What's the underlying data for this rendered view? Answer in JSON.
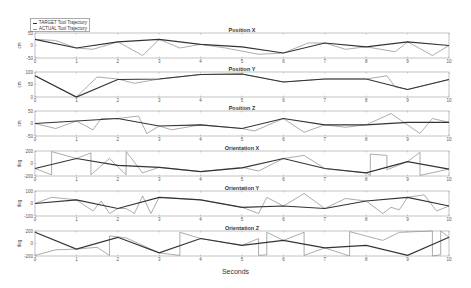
{
  "chart_data": {
    "type": "line",
    "xlabel": "Seconds",
    "xlim": [
      0,
      10
    ],
    "xticks": [
      0,
      1,
      2,
      3,
      4,
      5,
      6,
      7,
      8,
      9,
      10
    ],
    "legend": {
      "position": "top-left",
      "entries": [
        "TARGET Tool Trajectory",
        "ACTUAL Tool Trajectory"
      ]
    },
    "grid": false,
    "subplots": [
      {
        "title": "Position X",
        "ylabel": "cm",
        "ylim": [
          -50,
          50
        ],
        "yticks": [
          -50,
          0,
          50
        ],
        "target": {
          "x": [
            0,
            1,
            2,
            3,
            4,
            5,
            6,
            7,
            8,
            9,
            10
          ],
          "y": [
            25,
            -10,
            15,
            25,
            5,
            -5,
            -30,
            10,
            -5,
            15,
            0
          ]
        },
        "actual": {
          "x": [
            0,
            0.5,
            1,
            1.4,
            2,
            2.6,
            3,
            3.5,
            4,
            4.6,
            5.4,
            6,
            6.6,
            7,
            7.5,
            8,
            8.7,
            9,
            9.6,
            10
          ],
          "y": [
            25,
            20,
            -10,
            -15,
            15,
            -40,
            25,
            -10,
            5,
            -10,
            -35,
            -30,
            10,
            10,
            -15,
            -5,
            -25,
            15,
            -40,
            0
          ]
        }
      },
      {
        "title": "Position Y",
        "ylabel": "cm",
        "ylim": [
          0,
          100
        ],
        "yticks": [
          0,
          50,
          100
        ],
        "target": {
          "x": [
            0,
            1,
            2,
            3,
            4,
            5,
            6,
            7,
            8,
            9,
            10
          ],
          "y": [
            85,
            0,
            70,
            72,
            90,
            92,
            60,
            72,
            72,
            30,
            70
          ]
        },
        "actual": {
          "x": [
            0,
            1,
            1.5,
            2,
            2.4,
            3,
            4,
            5,
            6,
            7,
            8,
            8.5,
            8.7,
            9,
            10
          ],
          "y": [
            85,
            0,
            80,
            72,
            55,
            72,
            90,
            92,
            60,
            72,
            72,
            85,
            40,
            30,
            70
          ]
        }
      },
      {
        "title": "Position Z",
        "ylabel": "cm",
        "ylim": [
          -50,
          50
        ],
        "yticks": [
          -50,
          0,
          50
        ],
        "target": {
          "x": [
            0,
            1,
            2,
            3,
            4,
            5,
            6,
            7,
            8,
            9,
            10
          ],
          "y": [
            0,
            10,
            20,
            -10,
            -5,
            -20,
            20,
            -5,
            -5,
            5,
            5
          ]
        },
        "actual": {
          "x": [
            0,
            0.5,
            1,
            1.4,
            1.6,
            2,
            2.5,
            2.7,
            3,
            3.3,
            4,
            5,
            5.3,
            6,
            6.5,
            7,
            7.5,
            8,
            8.6,
            9.3,
            9.6,
            10
          ],
          "y": [
            0,
            -20,
            10,
            -25,
            20,
            20,
            30,
            -40,
            -10,
            -25,
            -5,
            -20,
            -30,
            20,
            -35,
            -5,
            -15,
            -5,
            40,
            -40,
            20,
            5
          ]
        }
      },
      {
        "title": "Orientation X",
        "ylabel": "deg",
        "ylim": [
          -200,
          200
        ],
        "yticks": [
          -200,
          0,
          200
        ],
        "target": {
          "x": [
            0,
            1,
            2,
            3,
            4,
            5,
            6,
            7,
            8,
            9,
            10
          ],
          "y": [
            -80,
            80,
            -30,
            -60,
            -130,
            -70,
            80,
            -80,
            -150,
            30,
            -90
          ]
        },
        "actual": {
          "x": [
            0,
            0.4,
            0.4,
            1,
            1.35,
            1.35,
            1.8,
            2.2,
            2.2,
            2.6,
            3,
            4,
            5,
            5.4,
            6,
            6.5,
            7,
            8,
            8.1,
            8.1,
            8.5,
            8.5,
            9,
            9.3,
            9.3,
            10
          ],
          "y": [
            -80,
            -180,
            190,
            80,
            170,
            -180,
            80,
            -180,
            190,
            -150,
            -60,
            -130,
            -60,
            -120,
            80,
            130,
            -80,
            -150,
            -190,
            150,
            130,
            -100,
            30,
            180,
            -190,
            -90
          ]
        }
      },
      {
        "title": "Orientation Y",
        "ylabel": "deg",
        "ylim": [
          -100,
          100
        ],
        "yticks": [
          -100,
          0,
          100
        ],
        "target": {
          "x": [
            0,
            1,
            2,
            3,
            4,
            5,
            6,
            7,
            8,
            9,
            10
          ],
          "y": [
            0,
            30,
            -40,
            50,
            30,
            -30,
            -20,
            -40,
            20,
            50,
            -20
          ]
        },
        "actual": {
          "x": [
            0,
            0.4,
            1,
            1.4,
            1.6,
            1.8,
            2,
            2.2,
            2.4,
            2.6,
            2.8,
            3,
            4,
            5,
            5.4,
            5.6,
            6,
            6.5,
            7,
            7.5,
            8,
            8.4,
            8.6,
            8.8,
            9,
            9.4,
            9.7,
            10
          ],
          "y": [
            0,
            50,
            30,
            -60,
            20,
            -80,
            -40,
            -40,
            -80,
            60,
            -80,
            50,
            30,
            -30,
            -80,
            50,
            -20,
            80,
            -40,
            40,
            20,
            -80,
            -30,
            -50,
            50,
            70,
            -60,
            -20
          ]
        }
      },
      {
        "title": "Orientation Z",
        "ylabel": "deg",
        "ylim": [
          -200,
          200
        ],
        "yticks": [
          -200,
          0,
          200
        ],
        "target": {
          "x": [
            0,
            1,
            2,
            3,
            4,
            5,
            6,
            7,
            8,
            9,
            10
          ],
          "y": [
            180,
            -90,
            100,
            -150,
            80,
            -30,
            50,
            -70,
            -30,
            -190,
            100
          ]
        },
        "actual": {
          "x": [
            0,
            0.5,
            1,
            1.5,
            1.8,
            1.8,
            2.2,
            2.5,
            3,
            3.5,
            3.5,
            4,
            5,
            5.4,
            5.4,
            5.6,
            5.6,
            6,
            6.5,
            6.5,
            7,
            7.6,
            7.6,
            8.4,
            8.8,
            9.6,
            9.6,
            9.8,
            9.8,
            10
          ],
          "y": [
            -190,
            -100,
            -90,
            -60,
            -190,
            120,
            90,
            0,
            -150,
            -190,
            180,
            80,
            -30,
            80,
            -190,
            -180,
            180,
            50,
            180,
            -190,
            -70,
            -200,
            190,
            50,
            180,
            200,
            -200,
            -180,
            200,
            100
          ]
        }
      }
    ]
  }
}
